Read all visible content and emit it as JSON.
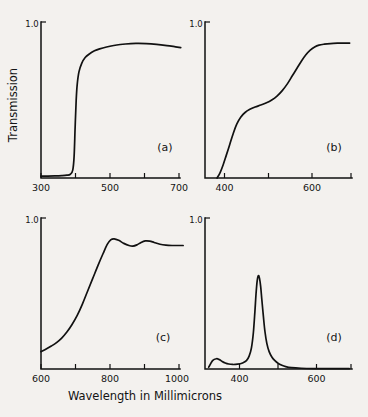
{
  "figure": {
    "xlabel": "Wavelength in Millimicrons",
    "ylabel": "Transmission",
    "ytop_label": "1.0"
  },
  "chart_data": [
    {
      "type": "line",
      "panel": "(a)",
      "title": "",
      "xlabel": "Wavelength in Millimicrons",
      "ylabel": "Transmission",
      "xlim": [
        290,
        710
      ],
      "ylim": [
        0,
        1.0
      ],
      "xticks": [
        300,
        400,
        500,
        600,
        700
      ],
      "xticklabels": [
        "300",
        "",
        "500",
        "",
        "700"
      ],
      "yticks": [
        1.0
      ],
      "yticklabels": [
        "1.0"
      ],
      "grid": false,
      "legend": "none",
      "description": "sharp-cut longpass filter",
      "x": [
        300,
        320,
        340,
        360,
        375,
        385,
        392,
        396,
        399,
        402,
        405,
        410,
        418,
        428,
        440,
        455,
        470,
        490,
        515,
        545,
        575,
        605,
        635,
        665,
        690,
        705
      ],
      "y": [
        0.012,
        0.012,
        0.013,
        0.015,
        0.018,
        0.024,
        0.05,
        0.14,
        0.33,
        0.5,
        0.6,
        0.68,
        0.735,
        0.772,
        0.795,
        0.815,
        0.828,
        0.84,
        0.851,
        0.859,
        0.863,
        0.862,
        0.857,
        0.849,
        0.841,
        0.836
      ]
    },
    {
      "type": "line",
      "panel": "(b)",
      "title": "",
      "xlabel": "Wavelength in Millimicrons",
      "ylabel": "Transmission",
      "xlim": [
        355,
        690
      ],
      "ylim": [
        0,
        1.0
      ],
      "xticks": [
        400,
        500,
        600,
        700
      ],
      "xticklabels": [
        "400",
        "",
        "600",
        ""
      ],
      "yticks": [
        1.0
      ],
      "yticklabels": [
        "1.0"
      ],
      "grid": false,
      "legend": "none",
      "description": "double-sigmoid rising transmission",
      "x": [
        383,
        390,
        397,
        404,
        412,
        420,
        428,
        437,
        447,
        458,
        470,
        483,
        496,
        508,
        520,
        532,
        544,
        555,
        566,
        576,
        586,
        596,
        606,
        616,
        628,
        642,
        658,
        675,
        686
      ],
      "y": [
        0.0,
        0.035,
        0.085,
        0.145,
        0.215,
        0.285,
        0.345,
        0.39,
        0.42,
        0.44,
        0.455,
        0.468,
        0.482,
        0.5,
        0.525,
        0.56,
        0.605,
        0.655,
        0.705,
        0.75,
        0.79,
        0.82,
        0.84,
        0.852,
        0.858,
        0.862,
        0.864,
        0.865,
        0.865
      ]
    },
    {
      "type": "line",
      "panel": "(c)",
      "title": "",
      "xlabel": "Wavelength in Millimicrons",
      "ylabel": "Transmission",
      "xlim": [
        590,
        1015
      ],
      "ylim": [
        0,
        1.0
      ],
      "xticks": [
        600,
        700,
        800,
        900,
        1000
      ],
      "xticklabels": [
        "600",
        "",
        "800",
        "",
        "1000"
      ],
      "yticks": [
        1.0
      ],
      "yticklabels": [
        "1.0"
      ],
      "grid": false,
      "legend": "none",
      "description": "infrared longpass with interference ripples",
      "x": [
        600,
        615,
        630,
        645,
        660,
        675,
        690,
        705,
        720,
        735,
        750,
        765,
        780,
        792,
        802,
        812,
        825,
        840,
        855,
        866,
        878,
        890,
        902,
        915,
        928,
        945,
        962,
        980,
        1000,
        1012
      ],
      "y": [
        0.115,
        0.132,
        0.152,
        0.175,
        0.205,
        0.245,
        0.295,
        0.355,
        0.43,
        0.515,
        0.6,
        0.685,
        0.765,
        0.825,
        0.855,
        0.862,
        0.852,
        0.832,
        0.818,
        0.814,
        0.822,
        0.838,
        0.848,
        0.847,
        0.838,
        0.826,
        0.82,
        0.818,
        0.818,
        0.818
      ]
    },
    {
      "type": "line",
      "panel": "(d)",
      "title": "",
      "xlabel": "Wavelength in Millimicrons",
      "ylabel": "Transmission",
      "xlim": [
        310,
        690
      ],
      "ylim": [
        0,
        1.0
      ],
      "xticks": [
        400,
        500,
        600,
        700
      ],
      "xticklabels": [
        "400",
        "",
        "600",
        ""
      ],
      "yticks": [
        1.0
      ],
      "yticklabels": [
        "1.0"
      ],
      "grid": false,
      "legend": "none",
      "description": "narrow bandpass filter peaking near 450 nm",
      "x": [
        320,
        330,
        340,
        348,
        355,
        363,
        372,
        382,
        395,
        408,
        418,
        425,
        431,
        436,
        440,
        443,
        446,
        449,
        452,
        455,
        458,
        462,
        466,
        471,
        477,
        484,
        492,
        500,
        510,
        520,
        535,
        560,
        600,
        650,
        685
      ],
      "y": [
        0.012,
        0.055,
        0.068,
        0.062,
        0.05,
        0.04,
        0.033,
        0.03,
        0.032,
        0.04,
        0.055,
        0.085,
        0.14,
        0.24,
        0.38,
        0.5,
        0.585,
        0.618,
        0.6,
        0.545,
        0.46,
        0.35,
        0.25,
        0.17,
        0.115,
        0.08,
        0.055,
        0.038,
        0.025,
        0.016,
        0.009,
        0.005,
        0.003,
        0.002,
        0.002
      ]
    }
  ]
}
